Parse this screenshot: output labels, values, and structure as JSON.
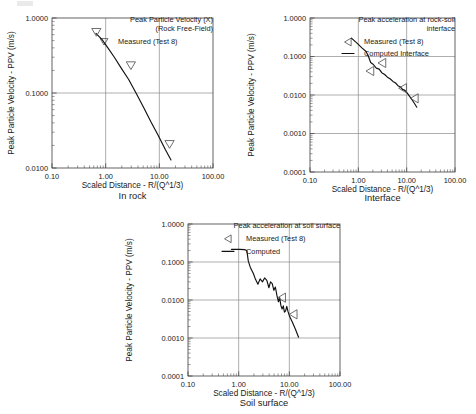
{
  "page": {
    "width": 476,
    "height": 414,
    "background": "#ffffff",
    "curve_color": "#111111",
    "grid_color": "#8c8c8c",
    "axis_color": "#3d3d3d",
    "marker_color": "#555555"
  },
  "common": {
    "xlabel": "Scaled Distance  -  R/(Q^1/3)",
    "ylabel": "Peak Particle Velocity  -  PPV (m/s)",
    "xticks": [
      "0.10",
      "1.00",
      "10.00",
      "100.00"
    ],
    "xlim": [
      0.1,
      100.0
    ]
  },
  "chart_data": [
    {
      "id": "chart1",
      "type": "line",
      "caption": "In rock",
      "title_lines": [
        "Peak Particle Velocity (X)",
        "(Rock Free-Field)"
      ],
      "xlabel": "Scaled Distance  -  R/(Q^1/3)",
      "ylabel": "Peak Particle Velocity  -  PPV (m/s)",
      "xlim": [
        0.1,
        100.0
      ],
      "ylim": [
        0.01,
        1.0
      ],
      "yticks": [
        "1.0000",
        "0.1000",
        "0.0100"
      ],
      "xticks": [
        "0.10",
        "1.00",
        "10.00",
        "100.00"
      ],
      "grid": true,
      "legend_position": "top-right",
      "legend": [
        {
          "label": "Measured (Test 8)",
          "symbol": "triangle-down",
          "kind": "marker"
        }
      ],
      "series": [
        {
          "name": "Computed",
          "kind": "line",
          "points": [
            [
              0.66,
              0.625
            ],
            [
              0.85,
              0.52
            ],
            [
              1.1,
              0.4
            ],
            [
              1.45,
              0.3
            ],
            [
              1.95,
              0.215
            ],
            [
              2.7,
              0.15
            ],
            [
              3.7,
              0.099
            ],
            [
              5.1,
              0.064
            ],
            [
              7.0,
              0.041
            ],
            [
              9.6,
              0.027
            ],
            [
              13.0,
              0.0175
            ],
            [
              16.5,
              0.0128
            ]
          ]
        },
        {
          "name": "Measured (Test 8)",
          "kind": "marker",
          "symbol": "triangle-down",
          "points": [
            [
              0.67,
              0.64
            ],
            [
              2.95,
              0.23
            ],
            [
              15.5,
              0.0205
            ]
          ]
        }
      ]
    },
    {
      "id": "chart2",
      "type": "line",
      "caption": "Interface",
      "title_lines": [
        "Peak acceleration at rock-soil",
        "interface"
      ],
      "xlabel": "Scaled Distance  -  R/(Q^1/3)",
      "ylabel": "Peak Particle Velocity  -  PPV (m/s)",
      "xlim": [
        0.1,
        100.0
      ],
      "ylim": [
        0.0001,
        1.0
      ],
      "yticks": [
        "1.0000",
        "0.1000",
        "0.0100",
        "0.0010",
        "0.0001"
      ],
      "xticks": [
        "0.10",
        "1.00",
        "10.00",
        "100.00"
      ],
      "grid": true,
      "legend_position": "top-right",
      "legend": [
        {
          "label": "Measured (Test 8)",
          "symbol": "triangle-left",
          "kind": "marker"
        },
        {
          "label": "Computed Interface",
          "symbol": "line",
          "kind": "line"
        }
      ],
      "series": [
        {
          "name": "Computed Interface",
          "kind": "line",
          "points": [
            [
              0.72,
              0.3
            ],
            [
              0.95,
              0.22
            ],
            [
              1.2,
              0.165
            ],
            [
              1.45,
              0.135
            ],
            [
              1.62,
              0.1
            ],
            [
              1.8,
              0.07
            ],
            [
              2.05,
              0.062
            ],
            [
              2.35,
              0.05
            ],
            [
              2.7,
              0.047
            ],
            [
              3.05,
              0.038
            ],
            [
              3.5,
              0.034
            ],
            [
              4.0,
              0.029
            ],
            [
              4.6,
              0.026
            ],
            [
              5.2,
              0.0225
            ],
            [
              5.9,
              0.0205
            ],
            [
              6.6,
              0.0175
            ],
            [
              7.4,
              0.0162
            ],
            [
              8.2,
              0.014
            ],
            [
              9.2,
              0.0132
            ],
            [
              10.3,
              0.0112
            ],
            [
              11.5,
              0.0092
            ],
            [
              13.0,
              0.0074
            ],
            [
              14.5,
              0.006
            ],
            [
              16.2,
              0.0048
            ]
          ]
        },
        {
          "name": "Measured (Test 8)",
          "kind": "marker",
          "symbol": "triangle-left",
          "points": [
            [
              1.75,
              0.042
            ],
            [
              3.1,
              0.068
            ],
            [
              8.3,
              0.015
            ],
            [
              14.5,
              0.0082
            ]
          ]
        }
      ]
    },
    {
      "id": "chart3",
      "type": "line",
      "caption": "Soil surface",
      "title_lines": [
        "Peak acceleration at soil surface"
      ],
      "xlabel": "Scaled Distance  -  R/(Q^1/3)",
      "ylabel": "Peak Particle Velocity  -  PPV (m/s)",
      "xlim": [
        0.1,
        100.0
      ],
      "ylim": [
        0.0001,
        1.0
      ],
      "yticks": [
        "1.0000",
        "0.1000",
        "0.0100",
        "0.0010",
        "0.0001"
      ],
      "xticks": [
        "0.10",
        "1.00",
        "10.00",
        "100.00"
      ],
      "grid": true,
      "legend_position": "top-right",
      "legend": [
        {
          "label": "Measured (Test 8)",
          "symbol": "triangle-left",
          "kind": "marker"
        },
        {
          "label": "Computed",
          "symbol": "line",
          "kind": "line"
        }
      ],
      "series": [
        {
          "name": "Computed",
          "kind": "line",
          "points": [
            [
              0.72,
              0.215
            ],
            [
              1.05,
              0.215
            ],
            [
              1.3,
              0.212
            ],
            [
              1.45,
              0.2
            ],
            [
              1.55,
              0.105
            ],
            [
              1.7,
              0.072
            ],
            [
              1.95,
              0.05
            ],
            [
              2.15,
              0.035
            ],
            [
              2.4,
              0.026
            ],
            [
              2.65,
              0.036
            ],
            [
              2.95,
              0.03
            ],
            [
              3.25,
              0.038
            ],
            [
              3.6,
              0.033
            ],
            [
              3.95,
              0.021
            ],
            [
              4.25,
              0.03
            ],
            [
              4.6,
              0.027
            ],
            [
              4.95,
              0.018
            ],
            [
              5.3,
              0.022
            ],
            [
              5.7,
              0.013
            ],
            [
              6.1,
              0.009
            ],
            [
              6.45,
              0.0115
            ],
            [
              6.8,
              0.0072
            ],
            [
              7.2,
              0.0058
            ],
            [
              7.6,
              0.007
            ],
            [
              8.0,
              0.0048
            ],
            [
              8.45,
              0.0052
            ],
            [
              8.9,
              0.0068
            ],
            [
              9.4,
              0.005
            ],
            [
              10.2,
              0.0036
            ],
            [
              11.5,
              0.0026
            ],
            [
              13.2,
              0.0017
            ],
            [
              15.2,
              0.00105
            ]
          ]
        },
        {
          "name": "Measured (Test 8)",
          "kind": "marker",
          "symbol": "triangle-left",
          "points": [
            [
              7.1,
              0.0115
            ],
            [
              12.0,
              0.0042
            ]
          ]
        }
      ]
    }
  ]
}
